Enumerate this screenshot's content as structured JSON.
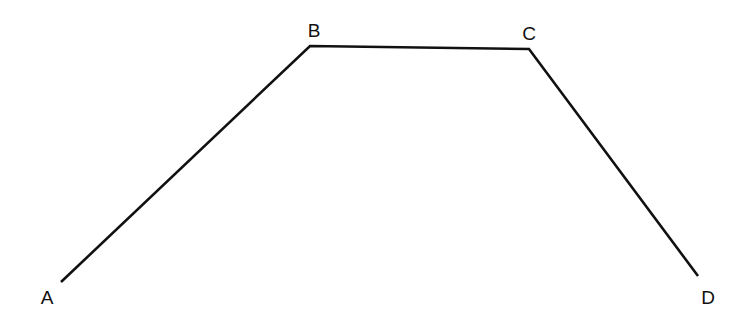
{
  "diagram": {
    "type": "polyline",
    "stroke_color": "#111111",
    "points": [
      {
        "label": "A",
        "x": 61,
        "y": 282,
        "label_x": 47,
        "label_y": 297
      },
      {
        "label": "B",
        "x": 310,
        "y": 46,
        "label_x": 314,
        "label_y": 30
      },
      {
        "label": "C",
        "x": 529,
        "y": 49,
        "label_x": 529,
        "label_y": 33
      },
      {
        "label": "D",
        "x": 698,
        "y": 276,
        "label_x": 708,
        "label_y": 297
      }
    ],
    "labels": {
      "a": "A",
      "b": "B",
      "c": "C",
      "d": "D"
    }
  }
}
